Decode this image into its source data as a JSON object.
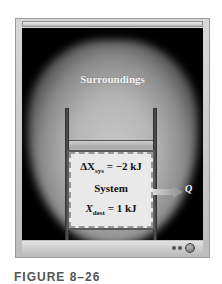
{
  "figure": {
    "surroundings_label": "Surroundings",
    "equation_top": {
      "symbol": "ΔX",
      "subscript": "sys",
      "rhs": "= −2 kJ"
    },
    "system_label": "System",
    "equation_bottom": {
      "symbol": "X",
      "subscript": "dest",
      "rhs": "= 1 kJ"
    },
    "heat_label": "Q",
    "caption": "FIGURE 8–26"
  },
  "controls": {
    "dots_icon": "more-dots-icon",
    "circle_icon": "circle-button-icon"
  },
  "colors": {
    "background": "#000000",
    "glow": "#b5b5b5",
    "frame": "#c8c8c8",
    "system_fill": "#e9e9e9",
    "wall": "#4a4a4a"
  }
}
